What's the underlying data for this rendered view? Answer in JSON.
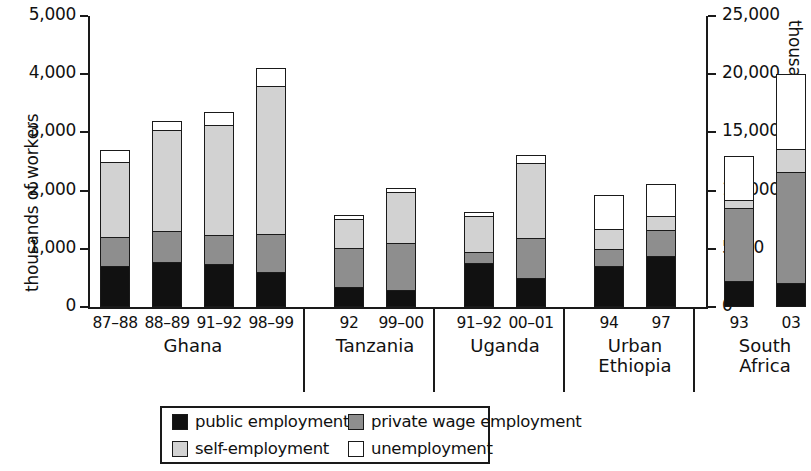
{
  "chart_data": {
    "type": "bar",
    "subtype": "stacked",
    "title": "",
    "xlabel": "",
    "ylabel": "thousands of workers",
    "y2label": "thousands of workers",
    "ylim": [
      0,
      5000
    ],
    "y2lim": [
      0,
      25000
    ],
    "grid": false,
    "legend_position": "bottom-center",
    "y_ticks": [
      "0",
      "1,000",
      "2,000",
      "3,000",
      "4,000",
      "5,000"
    ],
    "y_tick_values": [
      0,
      1000,
      2000,
      3000,
      4000,
      5000
    ],
    "y2_ticks": [
      "0",
      "5000",
      "10,000",
      "15,000",
      "20,000",
      "25,000"
    ],
    "y2_tick_values": [
      0,
      5000,
      10000,
      15000,
      20000,
      25000
    ],
    "series": [
      {
        "name": "public employment",
        "color": "#111111"
      },
      {
        "name": "private wage employment",
        "color": "#8e8e8e"
      },
      {
        "name": "self-employment",
        "color": "#d2d2d2"
      },
      {
        "name": "unemployment",
        "color": "#ffffff"
      }
    ],
    "groups": [
      {
        "name": "Ghana",
        "axis": "left",
        "bars": [
          {
            "year": "87–88",
            "public": 700,
            "private": 510,
            "self": 1290,
            "unemployment": 190,
            "total": 2690
          },
          {
            "year": "88–89",
            "public": 780,
            "private": 530,
            "self": 1740,
            "unemployment": 140,
            "total": 3190
          },
          {
            "year": "91–92",
            "public": 740,
            "private": 500,
            "self": 1890,
            "unemployment": 220,
            "total": 3350
          },
          {
            "year": "98–99",
            "public": 600,
            "private": 650,
            "self": 2550,
            "unemployment": 300,
            "total": 4100
          }
        ]
      },
      {
        "name": "Tanzania",
        "axis": "left",
        "bars": [
          {
            "year": "92",
            "public": 350,
            "private": 660,
            "self": 510,
            "unemployment": 60,
            "total": 1580
          },
          {
            "year": "99–00",
            "public": 300,
            "private": 800,
            "self": 880,
            "unemployment": 60,
            "total": 2040
          }
        ]
      },
      {
        "name": "Uganda",
        "axis": "left",
        "bars": [
          {
            "year": "91–92",
            "public": 760,
            "private": 190,
            "self": 620,
            "unemployment": 60,
            "total": 1630
          },
          {
            "year": "00–01",
            "public": 490,
            "private": 700,
            "self": 1280,
            "unemployment": 140,
            "total": 2610
          }
        ]
      },
      {
        "name": "Urban\nEthiopia",
        "axis": "left",
        "bars": [
          {
            "year": "94",
            "public": 700,
            "private": 300,
            "self": 340,
            "unemployment": 580,
            "total": 1920
          },
          {
            "year": "97",
            "public": 870,
            "private": 460,
            "self": 240,
            "unemployment": 540,
            "total": 2110
          }
        ]
      },
      {
        "name": "South\nAfrica",
        "axis": "right",
        "bars": [
          {
            "year": "93",
            "public": 2250,
            "private": 6250,
            "self": 700,
            "unemployment": 3800,
            "total": 13000
          },
          {
            "year": "03",
            "public": 2100,
            "private": 9500,
            "self": 1950,
            "unemployment": 6450,
            "total": 20000
          }
        ]
      }
    ]
  },
  "legend": {
    "items": [
      {
        "key": "public",
        "label": "public employment"
      },
      {
        "key": "private",
        "label": "private wage employment"
      },
      {
        "key": "self",
        "label": "self-employment"
      },
      {
        "key": "unemp",
        "label": "unemployment"
      }
    ]
  }
}
